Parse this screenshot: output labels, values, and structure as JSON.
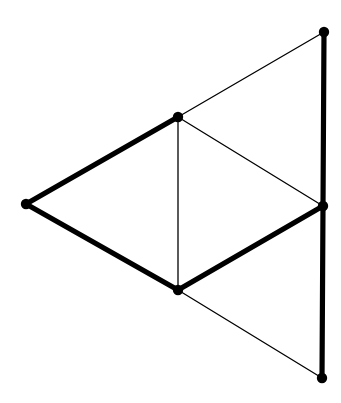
{
  "figure": {
    "canvas": {
      "width": 341,
      "height": 403
    },
    "background_color": "#ffffff",
    "ink_color": "#000000",
    "stroke_widths": {
      "thin": 1.3,
      "thick": 5.2
    },
    "vertex_radius": 5.2
  },
  "chart_data": {
    "type": "diagram",
    "coordinate_space": {
      "xlim": [
        0,
        341
      ],
      "ylim": [
        0,
        403
      ],
      "origin": "top-left"
    },
    "grid": false,
    "legend": false,
    "vertices": [
      {
        "id": "A",
        "name": "left-apex",
        "x": 26,
        "y": 204,
        "marker": "filled-circle"
      },
      {
        "id": "B",
        "name": "center-top",
        "x": 178,
        "y": 117,
        "marker": "filled-circle"
      },
      {
        "id": "C",
        "name": "center-bottom",
        "x": 178,
        "y": 290,
        "marker": "filled-circle"
      },
      {
        "id": "D",
        "name": "right-middle",
        "x": 323,
        "y": 206,
        "marker": "filled-circle"
      },
      {
        "id": "E",
        "name": "top-right",
        "x": 324,
        "y": 32,
        "marker": "filled-circle"
      },
      {
        "id": "F",
        "name": "bottom-right",
        "x": 322,
        "y": 378,
        "marker": "filled-circle"
      }
    ],
    "edges": [
      {
        "id": "e1",
        "name": "edge-left-to-center-top",
        "from": "A",
        "to": "B",
        "weight": "thick"
      },
      {
        "id": "e2",
        "name": "edge-left-to-center-bottom",
        "from": "A",
        "to": "C",
        "weight": "thick"
      },
      {
        "id": "e3",
        "name": "edge-center-top-to-center-bottom",
        "from": "B",
        "to": "C",
        "weight": "thin"
      },
      {
        "id": "e4",
        "name": "edge-center-top-to-top-right",
        "from": "B",
        "to": "E",
        "weight": "thin"
      },
      {
        "id": "e5",
        "name": "edge-center-top-to-right-middle",
        "from": "B",
        "to": "D",
        "weight": "thin"
      },
      {
        "id": "e6",
        "name": "edge-center-bottom-to-right-middle",
        "from": "C",
        "to": "D",
        "weight": "thick"
      },
      {
        "id": "e7",
        "name": "edge-center-bottom-to-bottom-right",
        "from": "C",
        "to": "F",
        "weight": "thin"
      },
      {
        "id": "e8",
        "name": "edge-top-right-to-right-middle",
        "from": "E",
        "to": "D",
        "weight": "thick"
      },
      {
        "id": "e9",
        "name": "edge-right-middle-to-bottom-right",
        "from": "D",
        "to": "F",
        "weight": "thick"
      }
    ]
  }
}
